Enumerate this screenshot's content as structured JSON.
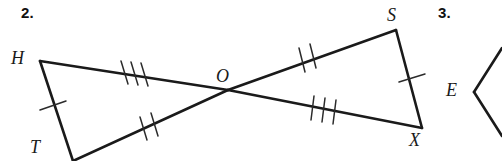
{
  "page": {
    "background_color": "#ffffff",
    "width": 502,
    "height": 161
  },
  "problems": [
    {
      "number": "2.",
      "id": "prob-num-2"
    },
    {
      "number": "3.",
      "id": "prob-num-3"
    }
  ],
  "figure": {
    "stroke_color": "#1a1a1a",
    "tick_color": "#2b2b2b",
    "line_width": 2.6,
    "tick_width": 1.5,
    "vertices": [
      {
        "name": "H",
        "label": "H",
        "x": 40,
        "y": 61
      },
      {
        "name": "T",
        "label": "T",
        "x": 73,
        "y": 161
      },
      {
        "name": "O",
        "label": "O",
        "x": 228,
        "y": 90
      },
      {
        "name": "S",
        "label": "S",
        "x": 396,
        "y": 30
      },
      {
        "name": "X",
        "label": "X",
        "x": 422,
        "y": 128
      },
      {
        "name": "E",
        "label": "E",
        "x": 474,
        "y": 92
      }
    ],
    "segments": [
      {
        "name": "segment-H-O",
        "from": "H",
        "to": "O",
        "ticks": 3
      },
      {
        "name": "segment-T-O",
        "from": "T",
        "to": "O",
        "ticks": 2
      },
      {
        "name": "segment-H-T",
        "from": "H",
        "to": "T",
        "ticks": 1
      },
      {
        "name": "segment-O-S",
        "from": "O",
        "to": "S",
        "ticks": 2
      },
      {
        "name": "segment-O-X",
        "from": "O",
        "to": "X",
        "ticks": 3
      },
      {
        "name": "segment-S-X",
        "from": "S",
        "to": "X",
        "ticks": 1
      }
    ],
    "partial_figure_3": {
      "name": "partial-triangle-E",
      "vertex": "E",
      "rays": [
        {
          "name": "ray-E-upper",
          "to_x": 502,
          "to_y": 48
        },
        {
          "name": "ray-E-lower",
          "to_x": 502,
          "to_y": 136
        }
      ]
    }
  },
  "labels": {
    "H": "H",
    "T": "T",
    "O": "O",
    "S": "S",
    "X": "X",
    "E": "E"
  }
}
